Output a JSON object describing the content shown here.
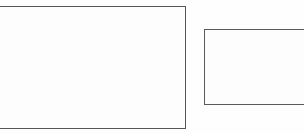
{
  "canvas": {
    "width": 304,
    "height": 134,
    "background_color": "#fefefe",
    "label": "diagram-canvas"
  },
  "diagram": {
    "title": "",
    "shape_count": 2,
    "shapes": [
      {
        "id": "rect-large",
        "name": "large-rectangle",
        "type": "rectangle",
        "label": "",
        "fill_color": "#fdfdfd",
        "stroke_color": "#565656",
        "stroke_width": 1,
        "x": -44,
        "y": 6,
        "width": 230,
        "height": 123,
        "right_edge_x": 185,
        "bottom_edge_y": 128,
        "cropped_edges": "left"
      },
      {
        "id": "rect-small",
        "name": "small-rectangle",
        "type": "rectangle",
        "label": "",
        "fill_color": "#fdfdfd",
        "stroke_color": "#5a5a5a",
        "stroke_width": 1,
        "x": 204,
        "y": 29,
        "width": 128,
        "height": 76,
        "right_edge_x": 332,
        "bottom_edge_y": 104,
        "cropped_edges": "right"
      }
    ]
  }
}
